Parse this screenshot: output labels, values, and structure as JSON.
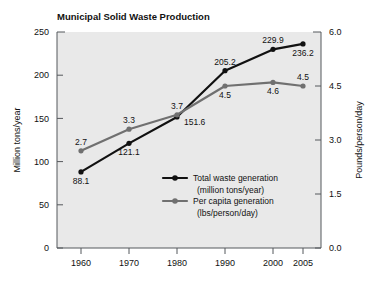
{
  "chart_data": {
    "type": "line",
    "title": "Municipal Solid Waste Production",
    "xlabel": "",
    "categories": [
      "1960",
      "1970",
      "1980",
      "1990",
      "2000",
      "2005"
    ],
    "x_positions": [
      81,
      129,
      177,
      225,
      273,
      303
    ],
    "grid": false,
    "legend_position": "inside-center-right",
    "axes": {
      "left": {
        "label": "Million tons/year",
        "ticks": [
          "0",
          "50",
          "100",
          "150",
          "200",
          "250"
        ],
        "tick_values": [
          0,
          50,
          100,
          150,
          200,
          250
        ],
        "range": [
          0,
          250
        ]
      },
      "right": {
        "label": "Pounds/person/day",
        "ticks": [
          "0.0",
          "1.5",
          "3.0",
          "4.5",
          "6.0"
        ],
        "tick_values": [
          0.0,
          1.5,
          3.0,
          4.5,
          6.0
        ],
        "range": [
          0.0,
          6.0
        ]
      }
    },
    "series": [
      {
        "name": "Total waste generation",
        "units": "(million tons/year)",
        "legend_line1": "Total waste generation",
        "legend_line2": "(million tons/year)",
        "axis": "left",
        "color": "#111111",
        "values": [
          88.1,
          121.1,
          151.6,
          205.2,
          229.9,
          236.2
        ],
        "labels": [
          "88.1",
          "121.1",
          "151.6",
          "205.2",
          "229.9",
          "236.2"
        ],
        "label_positions": [
          "below",
          "below",
          "right",
          "above",
          "above",
          "below"
        ]
      },
      {
        "name": "Per capita generation",
        "units": "(lbs/person/day)",
        "legend_line1": "Per capita generation",
        "legend_line2": "(lbs/person/day)",
        "axis": "right",
        "color": "#707070",
        "values": [
          2.7,
          3.3,
          3.7,
          4.5,
          4.6,
          4.5
        ],
        "labels": [
          "2.7",
          "3.3",
          "3.7",
          "4.5",
          "4.6",
          "4.5"
        ],
        "label_positions": [
          "above",
          "above",
          "above",
          "below",
          "below",
          "above"
        ]
      }
    ]
  }
}
